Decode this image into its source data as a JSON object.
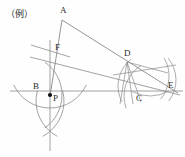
{
  "figure": {
    "caption": "（例）",
    "caption_pos": [
      6,
      9
    ],
    "stroke_color": "#8a8a8a",
    "stroke_color_dark": "#6d6d6d",
    "label_color": "#2b2b2b",
    "point_color": "#101010",
    "background": "#fefefe",
    "width": 185,
    "height": 157
  },
  "points": [
    {
      "name": "A",
      "x": 62,
      "y": 20,
      "label": "A",
      "label_x": 60,
      "label_y": 6,
      "marked": false
    },
    {
      "name": "F",
      "x": 52,
      "y": 50,
      "label": "F",
      "label_x": 55,
      "label_y": 43,
      "marked": false
    },
    {
      "name": "B",
      "x": 44,
      "y": 90,
      "label": "B",
      "label_x": 33,
      "label_y": 82,
      "marked": false
    },
    {
      "name": "P",
      "x": 50,
      "y": 95,
      "label": "P",
      "label_x": 53,
      "label_y": 94,
      "marked": true
    },
    {
      "name": "D",
      "x": 127,
      "y": 62,
      "label": "D",
      "label_x": 124,
      "label_y": 49,
      "marked": false
    },
    {
      "name": "C",
      "x": 139,
      "y": 90,
      "label": "C",
      "label_x": 136,
      "label_y": 94,
      "marked": false
    },
    {
      "name": "E",
      "x": 172,
      "y": 89,
      "label": "E",
      "label_x": 168,
      "label_y": 81,
      "marked": false
    }
  ],
  "segments": [
    {
      "name": "segment-A-E",
      "x1": 62,
      "y1": 20,
      "x2": 178,
      "y2": 93,
      "weight": 0.9
    },
    {
      "name": "segment-A-P",
      "x1": 62,
      "y1": 20,
      "x2": 50,
      "y2": 96,
      "weight": 0.9
    },
    {
      "name": "segment-F-E",
      "x1": 30,
      "y1": 57,
      "x2": 180,
      "y2": 95,
      "weight": 0.8
    },
    {
      "name": "segment-P-E",
      "x1": 10,
      "y1": 91,
      "x2": 183,
      "y2": 91,
      "weight": 0.8
    },
    {
      "name": "perp-bisector-F",
      "x1": 31,
      "y1": 45,
      "x2": 70,
      "y2": 57,
      "weight": 0.8
    },
    {
      "name": "vertical-P",
      "x1": 50,
      "y1": 40,
      "x2": 50,
      "y2": 151,
      "weight": 0.8
    },
    {
      "name": "ray-D-down-1",
      "x1": 127,
      "y1": 62,
      "x2": 120,
      "y2": 104,
      "weight": 0.7
    },
    {
      "name": "ray-D-down-2",
      "x1": 127,
      "y1": 62,
      "x2": 133,
      "y2": 104,
      "weight": 0.7
    },
    {
      "name": "ray-D-down-3",
      "x1": 127,
      "y1": 62,
      "x2": 141,
      "y2": 102,
      "weight": 0.7
    },
    {
      "name": "ray-D-right",
      "x1": 127,
      "y1": 62,
      "x2": 168,
      "y2": 73,
      "weight": 0.7
    },
    {
      "name": "ray-cross-DE",
      "x1": 113,
      "y1": 75,
      "x2": 176,
      "y2": 65,
      "weight": 0.7
    }
  ],
  "arcs": [
    {
      "name": "arc-P-major",
      "cx": 50,
      "cy": 68,
      "r": 40,
      "start": 25,
      "end": 155,
      "weight": 0.8
    },
    {
      "name": "arc-P-left",
      "cx": 22,
      "cy": 95,
      "r": 40,
      "start": -55,
      "end": 55,
      "weight": 0.8
    },
    {
      "name": "arc-P-below-l",
      "cx": 24,
      "cy": 101,
      "r": 40,
      "start": -15,
      "end": 62,
      "weight": 0.8
    },
    {
      "name": "arc-P-below-r",
      "cx": 76,
      "cy": 101,
      "r": 40,
      "start": 118,
      "end": 195,
      "weight": 0.8
    },
    {
      "name": "arc-D-1",
      "cx": 152,
      "cy": 86,
      "r": 34,
      "start": 152,
      "end": 232,
      "weight": 0.7
    },
    {
      "name": "arc-D-2",
      "cx": 160,
      "cy": 96,
      "r": 36,
      "start": 160,
      "end": 238,
      "weight": 0.7
    },
    {
      "name": "arc-E-1",
      "cx": 142,
      "cy": 80,
      "r": 34,
      "start": -40,
      "end": 38,
      "weight": 0.7
    },
    {
      "name": "arc-E-2",
      "cx": 133,
      "cy": 76,
      "r": 36,
      "start": -30,
      "end": 40,
      "weight": 0.7
    },
    {
      "name": "arc-C-small",
      "cx": 150,
      "cy": 58,
      "r": 38,
      "start": 60,
      "end": 118,
      "weight": 0.7
    }
  ]
}
